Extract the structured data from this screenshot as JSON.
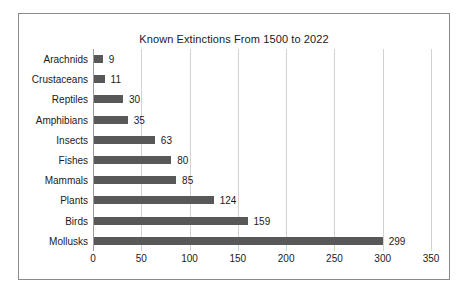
{
  "chart_data": {
    "type": "bar",
    "orientation": "horizontal",
    "title": "Known Extinctions From 1500 to 2022",
    "xlabel": "",
    "ylabel": "",
    "categories": [
      "Mollusks",
      "Birds",
      "Plants",
      "Mammals",
      "Fishes",
      "Insects",
      "Amphibians",
      "Reptiles",
      "Crustaceans",
      "Arachnids"
    ],
    "values": [
      299,
      159,
      124,
      85,
      80,
      63,
      35,
      30,
      11,
      9
    ],
    "data_labels": [
      "299",
      "159",
      "124",
      "85",
      "80",
      "63",
      "35",
      "30",
      "11",
      "9"
    ],
    "xlim": [
      0,
      350
    ],
    "xticks": [
      0,
      50,
      100,
      150,
      200,
      250,
      300,
      350
    ],
    "xtick_labels": [
      "0",
      "50",
      "100",
      "150",
      "200",
      "250",
      "300",
      "350"
    ],
    "grid": "vertical",
    "legend": null,
    "bar_color": "#585858",
    "gridline_color": "#d2d2d2",
    "axis_color": "#9a9a9a",
    "border_color": "#8a8a8a",
    "background_color": "#ffffff",
    "text_color": "#1a1a1a"
  }
}
